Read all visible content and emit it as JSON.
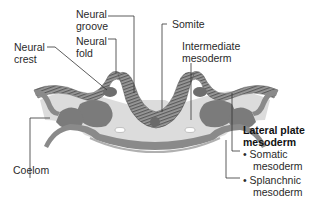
{
  "diagram": {
    "labels": {
      "neural_groove": [
        "Neural",
        "groove"
      ],
      "neural_fold": [
        "Neural",
        "fold"
      ],
      "neural_crest": [
        "Neural",
        "crest"
      ],
      "somite": "Somite",
      "intermediate_mesoderm": [
        "Intermediate",
        "mesoderm"
      ],
      "coelom": "Coelom",
      "lateral_plate_mesoderm": [
        "Lateral plate",
        "mesoderm"
      ],
      "somatic_mesoderm": [
        "Somatic",
        "mesoderm"
      ],
      "splanchnic_mesoderm": [
        "Splanchnic",
        "mesoderm"
      ],
      "bullet": "•"
    },
    "colors": {
      "ectoderm": "#8a8a8a",
      "mesoderm": "#7a7a7a",
      "background_tissue": "#d9d9d9",
      "leader_line": "#333333"
    }
  }
}
